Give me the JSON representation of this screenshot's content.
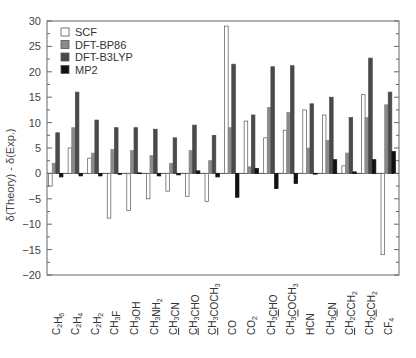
{
  "chart_data": {
    "type": "bar",
    "title": "",
    "xlabel": "",
    "ylabel": "δ(Theory) - δ(Exp.)",
    "ylim": [
      -20,
      30
    ],
    "yticks": [
      -20,
      -15,
      -10,
      -5,
      0,
      5,
      10,
      15,
      20,
      25,
      30
    ],
    "grid": false,
    "legend_position": "upper-left",
    "categories": [
      {
        "base": "C2H6",
        "parts": [
          [
            "C",
            ""
          ],
          [
            "2",
            "sub"
          ],
          [
            "H",
            ""
          ],
          [
            "6",
            "sub"
          ]
        ]
      },
      {
        "base": "C2H4",
        "parts": [
          [
            "C",
            ""
          ],
          [
            "2",
            "sub"
          ],
          [
            "H",
            ""
          ],
          [
            "4",
            "sub"
          ]
        ]
      },
      {
        "base": "C2H2",
        "parts": [
          [
            "C",
            ""
          ],
          [
            "2",
            "sub"
          ],
          [
            "H",
            ""
          ],
          [
            "2",
            "sub"
          ]
        ]
      },
      {
        "base": "CH3F",
        "parts": [
          [
            "CH",
            ""
          ],
          [
            "3",
            "sub"
          ],
          [
            "F",
            ""
          ]
        ]
      },
      {
        "base": "CH3OH",
        "parts": [
          [
            "CH",
            ""
          ],
          [
            "3",
            "sub"
          ],
          [
            "OH",
            ""
          ]
        ]
      },
      {
        "base": "CH3NH2",
        "parts": [
          [
            "CH",
            ""
          ],
          [
            "3",
            "sub"
          ],
          [
            "NH",
            ""
          ],
          [
            "2",
            "sub"
          ]
        ]
      },
      {
        "base": "CH3CN (C1)",
        "parts": [
          [
            "C",
            "u"
          ],
          [
            "H",
            ""
          ],
          [
            "3",
            "sub"
          ],
          [
            "CN",
            ""
          ]
        ]
      },
      {
        "base": "CH3CHO (C1)",
        "parts": [
          [
            "C",
            "u"
          ],
          [
            "H",
            ""
          ],
          [
            "3",
            "sub"
          ],
          [
            "CHO",
            ""
          ]
        ]
      },
      {
        "base": "CH3COCH3 (C1)",
        "parts": [
          [
            "C",
            "u"
          ],
          [
            "H",
            ""
          ],
          [
            "3",
            "sub"
          ],
          [
            "COCH",
            ""
          ],
          [
            "3",
            "sub"
          ]
        ]
      },
      {
        "base": "CO",
        "parts": [
          [
            "CO",
            ""
          ]
        ]
      },
      {
        "base": "CO2",
        "parts": [
          [
            "CO",
            ""
          ],
          [
            "2",
            "sub"
          ]
        ]
      },
      {
        "base": "CH3CHO (C2)",
        "parts": [
          [
            "CH",
            ""
          ],
          [
            "3",
            "sub"
          ],
          [
            "C",
            "u"
          ],
          [
            "HO",
            ""
          ]
        ]
      },
      {
        "base": "CH3COCH3 (C2)",
        "parts": [
          [
            "CH",
            ""
          ],
          [
            "3",
            "sub"
          ],
          [
            "C",
            "u"
          ],
          [
            "OCH",
            ""
          ],
          [
            "3",
            "sub"
          ]
        ]
      },
      {
        "base": "HCN",
        "parts": [
          [
            "HCN",
            ""
          ]
        ]
      },
      {
        "base": "CH3CN (C2)",
        "parts": [
          [
            "CH",
            ""
          ],
          [
            "3",
            "sub"
          ],
          [
            "C",
            "u"
          ],
          [
            "N",
            ""
          ]
        ]
      },
      {
        "base": "CH2CCH2 (C1)",
        "parts": [
          [
            "C",
            "u"
          ],
          [
            "H",
            ""
          ],
          [
            "2",
            "sub"
          ],
          [
            "CCH",
            ""
          ],
          [
            "2",
            "sub"
          ]
        ]
      },
      {
        "base": "CH2CCH2 (C2)",
        "parts": [
          [
            "CH",
            ""
          ],
          [
            "2",
            "sub"
          ],
          [
            "C",
            "u"
          ],
          [
            "CH",
            ""
          ],
          [
            "2",
            "sub"
          ]
        ]
      },
      {
        "base": "CF4",
        "parts": [
          [
            "CF",
            ""
          ],
          [
            "4",
            "sub"
          ]
        ]
      }
    ],
    "series": [
      {
        "name": "SCF",
        "color": "#ffffff",
        "values": [
          -2.5,
          5,
          3,
          -8.8,
          -7.3,
          -5,
          -3.5,
          -4.5,
          -5.5,
          29,
          10.3,
          7,
          8.5,
          12.5,
          11.5,
          1.5,
          15.5,
          -16
        ]
      },
      {
        "name": "DFT-BP86",
        "color": "#8a8a8a",
        "values": [
          2,
          9,
          4,
          4.7,
          4.5,
          3.5,
          2,
          4.5,
          2.5,
          9,
          1.3,
          13,
          12,
          5,
          6.5,
          4,
          11,
          13.5
        ]
      },
      {
        "name": "DFT-B3LYP",
        "color": "#4a4a4a",
        "values": [
          8,
          16,
          10.5,
          9,
          9,
          8.7,
          7,
          9.5,
          7.5,
          21.5,
          11.5,
          21,
          21.2,
          13.7,
          15,
          11,
          22.7,
          16
        ]
      },
      {
        "name": "MP2",
        "color": "#111111",
        "values": [
          -0.7,
          -0.5,
          -0.5,
          -0.2,
          0.1,
          -0.5,
          -0.3,
          0.5,
          -0.7,
          -4.7,
          1,
          -3,
          -2,
          0,
          2.7,
          0.3,
          2.7,
          4.3
        ]
      }
    ]
  }
}
